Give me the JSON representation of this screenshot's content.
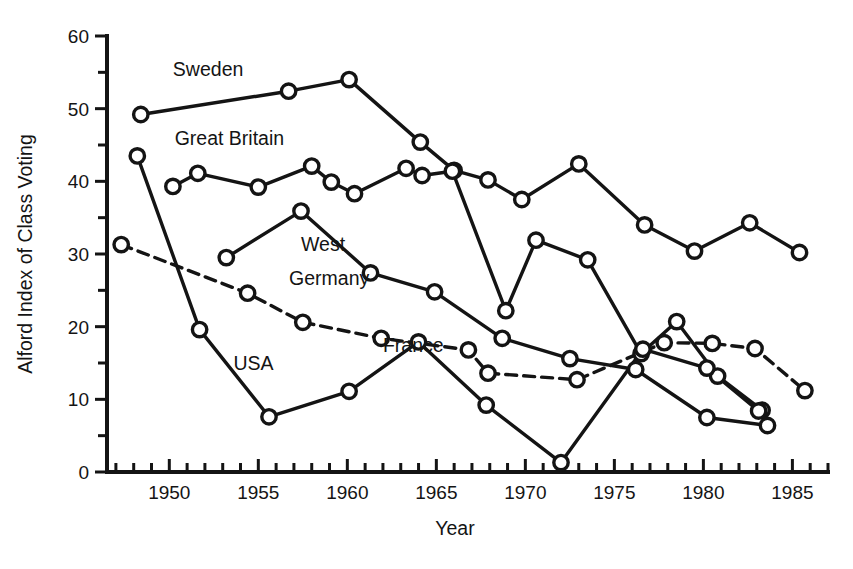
{
  "chart_data": {
    "type": "line",
    "title": "",
    "xlabel": "Year",
    "ylabel": "Alford Index of Class Voting",
    "xlim": [
      1946.5,
      1987
    ],
    "ylim": [
      0,
      60
    ],
    "xticks": [
      1950,
      1955,
      1960,
      1965,
      1970,
      1975,
      1980,
      1985
    ],
    "xtick_labels": [
      "1950",
      "1955",
      "1960",
      "1965",
      "1970",
      "1975",
      "1980",
      "1985"
    ],
    "x_minor_tick_step": 1,
    "yticks": [
      0,
      10,
      20,
      30,
      40,
      50,
      60
    ],
    "ytick_labels": [
      "0",
      "10",
      "20",
      "30",
      "40",
      "50",
      "60"
    ],
    "y_minor_tick_step": 5,
    "grid": false,
    "legend_position": "inline-annotations",
    "marker": "open-circle",
    "series": [
      {
        "name": "Sweden",
        "style": "solid",
        "label_x": 1950.2,
        "label_y": 55.3,
        "points": [
          {
            "x": 1948.4,
            "y": 49.2
          },
          {
            "x": 1956.7,
            "y": 52.4
          },
          {
            "x": 1960.1,
            "y": 54.0
          },
          {
            "x": 1964.1,
            "y": 45.4
          },
          {
            "x": 1966.0,
            "y": 41.5
          },
          {
            "x": 1967.9,
            "y": 40.2
          },
          {
            "x": 1969.8,
            "y": 37.5
          },
          {
            "x": 1973.0,
            "y": 42.4
          },
          {
            "x": 1976.7,
            "y": 34.0
          },
          {
            "x": 1979.5,
            "y": 30.4
          },
          {
            "x": 1982.6,
            "y": 34.3
          },
          {
            "x": 1985.4,
            "y": 30.2
          }
        ]
      },
      {
        "name": "Great Britain",
        "style": "solid",
        "label_x": 1950.3,
        "label_y": 45.8,
        "points": [
          {
            "x": 1950.2,
            "y": 39.3
          },
          {
            "x": 1951.6,
            "y": 41.1
          },
          {
            "x": 1955.0,
            "y": 39.2
          },
          {
            "x": 1958.0,
            "y": 42.1
          },
          {
            "x": 1959.1,
            "y": 39.9
          },
          {
            "x": 1960.4,
            "y": 38.3
          },
          {
            "x": 1963.3,
            "y": 41.8
          },
          {
            "x": 1964.2,
            "y": 40.8
          },
          {
            "x": 1965.9,
            "y": 41.4
          },
          {
            "x": 1968.9,
            "y": 22.2
          },
          {
            "x": 1970.6,
            "y": 31.9
          },
          {
            "x": 1973.5,
            "y": 29.2
          },
          {
            "x": 1976.5,
            "y": 16.3
          },
          {
            "x": 1978.5,
            "y": 20.7
          },
          {
            "x": 1980.8,
            "y": 13.2
          },
          {
            "x": 1983.3,
            "y": 8.5
          }
        ]
      },
      {
        "name": "West Germany",
        "style": "solid",
        "label_x": 1957.4,
        "label_y": 31.3,
        "label_line2_y": 26.6,
        "points": [
          {
            "x": 1953.2,
            "y": 29.5
          },
          {
            "x": 1957.4,
            "y": 35.9
          },
          {
            "x": 1961.3,
            "y": 27.4
          },
          {
            "x": 1964.9,
            "y": 24.8
          },
          {
            "x": 1968.7,
            "y": 18.4
          },
          {
            "x": 1972.5,
            "y": 15.6
          },
          {
            "x": 1976.2,
            "y": 14.1
          },
          {
            "x": 1980.2,
            "y": 7.5
          },
          {
            "x": 1983.6,
            "y": 6.4
          }
        ]
      },
      {
        "name": "France",
        "style": "dashed",
        "label_x": 1962.0,
        "label_y": 17.4,
        "points": [
          {
            "x": 1947.3,
            "y": 31.3
          },
          {
            "x": 1954.4,
            "y": 24.6
          },
          {
            "x": 1957.5,
            "y": 20.6
          },
          {
            "x": 1961.9,
            "y": 18.4
          },
          {
            "x": 1966.8,
            "y": 16.8
          },
          {
            "x": 1967.9,
            "y": 13.6
          },
          {
            "x": 1972.9,
            "y": 12.7
          },
          {
            "x": 1977.8,
            "y": 17.8
          },
          {
            "x": 1980.5,
            "y": 17.7
          },
          {
            "x": 1982.9,
            "y": 17.0
          },
          {
            "x": 1985.7,
            "y": 11.2
          }
        ]
      },
      {
        "name": "USA",
        "style": "solid",
        "label_x": 1953.6,
        "label_y": 14.8,
        "points": [
          {
            "x": 1948.2,
            "y": 43.5
          },
          {
            "x": 1951.7,
            "y": 19.6
          },
          {
            "x": 1955.6,
            "y": 7.6
          },
          {
            "x": 1960.1,
            "y": 11.1
          },
          {
            "x": 1964.0,
            "y": 17.9
          },
          {
            "x": 1967.8,
            "y": 9.2
          },
          {
            "x": 1972.0,
            "y": 1.3
          },
          {
            "x": 1976.6,
            "y": 16.9
          },
          {
            "x": 1980.2,
            "y": 14.3
          },
          {
            "x": 1983.1,
            "y": 8.4
          }
        ]
      }
    ]
  }
}
